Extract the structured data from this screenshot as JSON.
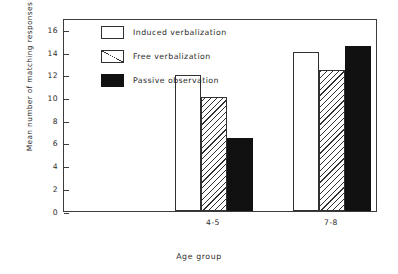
{
  "chart_data": {
    "type": "bar",
    "title": "",
    "xlabel": "Age group",
    "ylabel": "Mean number of matching responses",
    "categories": [
      "4-5",
      "7-8"
    ],
    "ylim": [
      0,
      17
    ],
    "yticks": [
      0,
      2,
      4,
      6,
      8,
      10,
      12,
      14,
      16
    ],
    "ytick_labels": [
      "0",
      "2",
      "4",
      "6",
      "8",
      "10",
      "12",
      "14",
      "16"
    ],
    "grid": false,
    "legend_position": "upper left inside",
    "series": [
      {
        "name": "Induced verbalization",
        "fill": "open",
        "values": [
          12.0,
          14.0
        ]
      },
      {
        "name": "Free verbalization",
        "fill": "hatch",
        "values": [
          10.0,
          12.4
        ]
      },
      {
        "name": "Passive observation",
        "fill": "solid",
        "values": [
          6.4,
          14.5
        ]
      }
    ]
  },
  "legend": {
    "items": [
      {
        "label": "Induced verbalization",
        "fill": "open"
      },
      {
        "label": "Free verbalization",
        "fill": "hatch"
      },
      {
        "label": "Passive observation",
        "fill": "solid"
      }
    ]
  },
  "axes": {
    "y_title": "Mean number of matching responses",
    "x_title": "Age group",
    "y_ticks": [
      "16",
      "14",
      "12",
      "10",
      "8",
      "6",
      "4",
      "2",
      "0"
    ],
    "x_groups": [
      "4-5",
      "7-8"
    ]
  },
  "colors": {
    "axis": "#3c3c3c",
    "bar_outline": "#303030",
    "solid_fill": "#111111",
    "background": "#ffffff",
    "text": "#2b2b2b"
  }
}
